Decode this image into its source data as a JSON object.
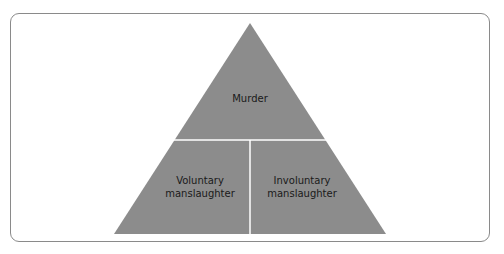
{
  "diagram": {
    "type": "pyramid",
    "fill_color": "#8c8c8c",
    "divider_color": "#ffffff",
    "tiers": [
      {
        "label": "Murder"
      },
      {
        "label_left": [
          "Voluntary",
          "manslaughter"
        ],
        "label_right": [
          "Involuntary",
          "manslaughter"
        ]
      }
    ]
  },
  "labels": {
    "top": "Murder",
    "left_l1": "Voluntary",
    "left_l2": "manslaughter",
    "right_l1": "Involuntary",
    "right_l2": "manslaughter"
  }
}
